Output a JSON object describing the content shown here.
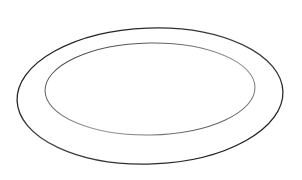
{
  "image": {
    "subject": "oval platter line drawing",
    "background": "#ffffff",
    "stroke_color": "#1a1a1a",
    "outer_rim": {
      "cx": 150,
      "cy": 96,
      "rx": 133,
      "ry": 68
    },
    "inner_well": {
      "cx": 150,
      "cy": 89,
      "rx": 105,
      "ry": 46
    }
  }
}
